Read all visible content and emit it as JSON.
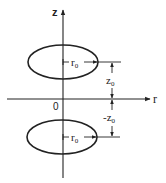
{
  "diagram": {
    "type": "two-ring cross-section in cylindrical coordinates",
    "colors": {
      "stroke": "#222222",
      "background": "#ffffff"
    },
    "axes": {
      "vertical": {
        "label": "z",
        "direction": "up"
      },
      "horizontal": {
        "label": "r",
        "direction": "right"
      },
      "origin_label": "0"
    },
    "rings": [
      {
        "position": "upper",
        "radius_label": "r",
        "radius_sub": "0",
        "offset_label": "z",
        "offset_sub": "0",
        "offset_prefix": ""
      },
      {
        "position": "lower",
        "radius_label": "r",
        "radius_sub": "0",
        "offset_label": "z",
        "offset_sub": "0",
        "offset_prefix": "-"
      }
    ]
  }
}
